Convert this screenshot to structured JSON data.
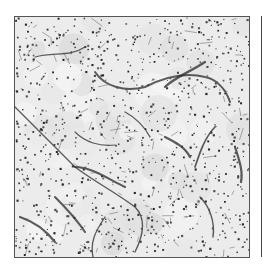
{
  "image": {
    "description": "Grayscale micrograph of tissue section showing scattered dark nuclei and branching dark vessel-like strands",
    "background_color": "#ececec",
    "stain_color": "#2a2a2a",
    "border_color": "#555555"
  },
  "vessels": [
    "M0,90 C20,110 40,130 60,150 C80,165 100,175 120,190 C130,200 130,215 120,235",
    "M60,150 C75,150 90,160 110,170",
    "M80,55 C90,70 110,75 130,70 C150,60 170,55 190,60 C200,62 210,70 215,85",
    "M150,70 C160,60 175,55 190,45",
    "M200,110 C190,120 185,135 180,150",
    "M220,130 C225,145 228,155 226,165",
    "M20,40 C40,35 55,40 70,30",
    "M60,115 C70,125 85,130 100,128",
    "M90,200 C80,215 75,225 78,240",
    "M150,120 C160,125 170,130 175,140",
    "M40,180 C50,190 60,200 70,215",
    "M110,95 C120,100 130,110 135,120",
    "M185,180 C195,190 200,205 198,220",
    "M5,200 C20,205 30,212 40,225"
  ]
}
